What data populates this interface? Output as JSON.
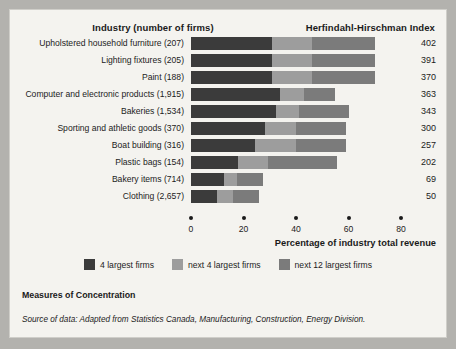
{
  "header": {
    "industry_title": "Industry (number of firms)",
    "hhi_title": "Herfindahl-Hirschman Index"
  },
  "footer": {
    "measures_label": "Measures of Concentration",
    "source_text": "Source of data: Adapted from Statistics Canada, Manufacturing, Construction, Energy Division."
  },
  "colors": {
    "background": "#b3b2ae",
    "panel": "#f4f3ef",
    "series_1": "#3b3b3b",
    "series_2": "#9d9d9d",
    "series_3": "#7b7b7b",
    "text": "#1c1c1c"
  },
  "chart_data": {
    "type": "bar",
    "orientation": "horizontal",
    "stacked": true,
    "title": "Industry (number of firms)",
    "xlabel": "Percentage of industry total revenue",
    "ylabel": "",
    "xlim": [
      0,
      80
    ],
    "xticks": [
      0,
      20,
      40,
      60,
      80
    ],
    "grid": false,
    "legend_position": "bottom",
    "value_axis_title": "Herfindahl-Hirschman Index",
    "categories": [
      "Upholstered household furniture  (207)",
      "Lighting fixtures  (205)",
      "Paint  (188)",
      "Computer and electronic products  (1,915)",
      "Bakeries  (1,534)",
      "Sporting and athletic goods  (370)",
      "Boat building (316)",
      "Plastic bags (154)",
      "Bakery items (714)",
      "Clothing  (2,657)"
    ],
    "series": [
      {
        "name": "4 largest firms",
        "color": "#3b3b3b",
        "values": [
          31,
          31,
          31,
          34,
          32.5,
          28,
          24.5,
          18,
          12.5,
          10
        ]
      },
      {
        "name": "next 4 largest firms",
        "color": "#9d9d9d",
        "values": [
          15,
          15,
          15,
          9,
          8.5,
          12,
          15.5,
          11.5,
          5,
          6
        ]
      },
      {
        "name": "next 12 largest firms",
        "color": "#7b7b7b",
        "values": [
          24,
          24,
          24,
          12,
          19,
          19,
          19,
          26,
          10,
          10
        ]
      }
    ],
    "annotations": [
      {
        "label": "402"
      },
      {
        "label": "391"
      },
      {
        "label": "370"
      },
      {
        "label": "363"
      },
      {
        "label": "343"
      },
      {
        "label": "300"
      },
      {
        "label": "257"
      },
      {
        "label": "202"
      },
      {
        "label": "69"
      },
      {
        "label": "50"
      }
    ],
    "rows": [
      {
        "label": "Upholstered household furniture  (207)",
        "s1": 31,
        "s2": 15,
        "s3": 24,
        "hhi": "402"
      },
      {
        "label": "Lighting fixtures  (205)",
        "s1": 31,
        "s2": 15,
        "s3": 24,
        "hhi": "391"
      },
      {
        "label": "Paint  (188)",
        "s1": 31,
        "s2": 15,
        "s3": 24,
        "hhi": "370"
      },
      {
        "label": "Computer and electronic products  (1,915)",
        "s1": 34,
        "s2": 9,
        "s3": 12,
        "hhi": "363"
      },
      {
        "label": "Bakeries  (1,534)",
        "s1": 32.5,
        "s2": 8.5,
        "s3": 19,
        "hhi": "343"
      },
      {
        "label": "Sporting and athletic goods  (370)",
        "s1": 28,
        "s2": 12,
        "s3": 19,
        "hhi": "300"
      },
      {
        "label": "Boat building (316)",
        "s1": 24.5,
        "s2": 15.5,
        "s3": 19,
        "hhi": "257"
      },
      {
        "label": "Plastic bags (154)",
        "s1": 18,
        "s2": 11.5,
        "s3": 26,
        "hhi": "202"
      },
      {
        "label": "Bakery items (714)",
        "s1": 12.5,
        "s2": 5,
        "s3": 10,
        "hhi": "69"
      },
      {
        "label": "Clothing  (2,657)",
        "s1": 10,
        "s2": 6,
        "s3": 10,
        "hhi": "50"
      }
    ],
    "legend": [
      {
        "label": "4 largest firms",
        "color": "#3b3b3b"
      },
      {
        "label": "next 4 largest firms",
        "color": "#9d9d9d"
      },
      {
        "label": "next 12 largest firms",
        "color": "#7b7b7b"
      }
    ],
    "tick_labels": [
      "0",
      "20",
      "40",
      "60",
      "80"
    ]
  }
}
